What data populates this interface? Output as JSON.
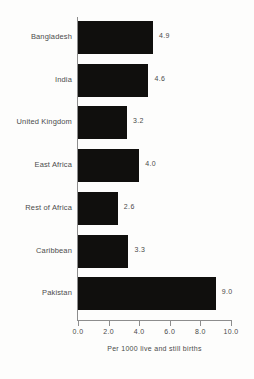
{
  "chart_data": {
    "type": "bar",
    "orientation": "horizontal",
    "title": "",
    "xlabel": "Per 1000 live and still births",
    "ylabel": "",
    "xlim": [
      0.0,
      10.0
    ],
    "xticks": [
      "0.0",
      "2.0",
      "4.0",
      "6.0",
      "8.0",
      "10.0"
    ],
    "xtick_values": [
      0.0,
      2.0,
      4.0,
      6.0,
      8.0,
      10.0
    ],
    "grid": false,
    "legend": null,
    "bar_color": "#100f0d",
    "categories": [
      "Bangladesh",
      "India",
      "United Kingdom",
      "East Africa",
      "Rest of Africa",
      "Caribbean",
      "Pakistan"
    ],
    "values": [
      4.9,
      4.6,
      3.2,
      4.0,
      2.6,
      3.3,
      9.0
    ],
    "value_labels": [
      "4.9",
      "4.6",
      "3.2",
      "4.0",
      "2.6",
      "3.3",
      "9.0"
    ]
  }
}
